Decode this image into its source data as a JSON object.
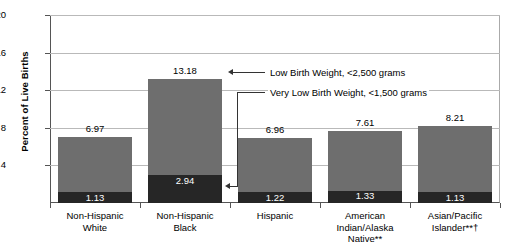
{
  "chart_data": {
    "type": "bar",
    "stacked": true,
    "title": "",
    "xlabel": "",
    "ylabel": "Percent of Live Births",
    "ylim": [
      0,
      20
    ],
    "yticks": [
      0,
      4,
      8,
      12,
      16,
      20
    ],
    "ytick_labels": [
      "",
      "4",
      "8",
      "12",
      "16",
      "20"
    ],
    "grid": true,
    "legend_position": "annotations",
    "categories": [
      "Non-Hispanic White",
      "Non-Hispanic Black",
      "Hispanic",
      "American Indian/Alaska Native**",
      "Asian/Pacific Islander**†"
    ],
    "category_lines": [
      [
        "Non-Hispanic",
        "White"
      ],
      [
        "Non-Hispanic",
        "Black"
      ],
      [
        "Hispanic"
      ],
      [
        "American",
        "Indian/Alaska Native**"
      ],
      [
        "Asian/Pacific",
        "Islander**†"
      ]
    ],
    "series": [
      {
        "name": "Low Birth Weight, <2,500 grams",
        "color": "#6e6e6e",
        "values": [
          6.97,
          13.18,
          6.96,
          7.61,
          8.21
        ],
        "labels": [
          "6.97",
          "13.18",
          "6.96",
          "7.61",
          "8.21"
        ]
      },
      {
        "name": "Very Low Birth Weight, <1,500 grams",
        "color": "#262626",
        "values": [
          1.13,
          2.94,
          1.22,
          1.33,
          1.13
        ],
        "labels": [
          "1.13",
          "2.94",
          "1.22",
          "1.33",
          "1.13"
        ]
      }
    ],
    "annotations": [
      {
        "id": "low-birth-weight",
        "text": "Low Birth Weight, <2,500 grams",
        "points_to": "Non-Hispanic Black total bar"
      },
      {
        "id": "very-low-birth-weight",
        "text": "Very Low Birth Weight, <1,500 grams",
        "points_to": "Non-Hispanic Black dark segment"
      }
    ]
  },
  "axis": {
    "y_title": "Percent of Live Births",
    "y_labels": {
      "t20": "20",
      "t16": "16",
      "t12": "12",
      "t8": "8",
      "t4": "4"
    }
  }
}
